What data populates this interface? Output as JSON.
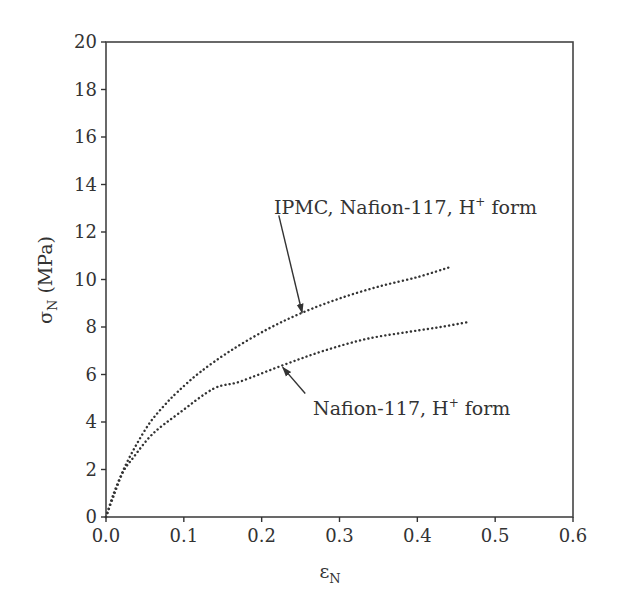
{
  "chart_data": {
    "type": "line",
    "title": "",
    "xlabel": "ε",
    "xlabel_sub": "N",
    "ylabel": "σ",
    "ylabel_sub": "N",
    "ylabel_unit": "(MPa)",
    "xlim": [
      0.0,
      0.6
    ],
    "ylim": [
      0,
      20
    ],
    "xticks": [
      "0.0",
      "0.1",
      "0.2",
      "0.3",
      "0.4",
      "0.5",
      "0.6"
    ],
    "yticks": [
      "0",
      "2",
      "4",
      "6",
      "8",
      "10",
      "12",
      "14",
      "16",
      "18",
      "20"
    ],
    "grid": false,
    "legend": "none (curves labeled with arrow annotations)",
    "series": [
      {
        "name": "IPMC, Nafion-117, H+ form",
        "style": "dotted",
        "x": [
          0.0,
          0.01,
          0.024,
          0.04,
          0.057,
          0.075,
          0.093,
          0.121,
          0.16,
          0.207,
          0.252,
          0.3,
          0.35,
          0.4,
          0.44
        ],
        "y": [
          0.0,
          1.0,
          2.1,
          3.1,
          4.0,
          4.7,
          5.3,
          6.1,
          7.0,
          7.9,
          8.6,
          9.2,
          9.7,
          10.1,
          10.5
        ]
      },
      {
        "name": "Nafion-117, H+ form",
        "style": "dotted",
        "x": [
          0.0,
          0.01,
          0.022,
          0.035,
          0.06,
          0.095,
          0.138,
          0.172,
          0.228,
          0.28,
          0.335,
          0.39,
          0.43,
          0.464
        ],
        "y": [
          0.0,
          0.9,
          1.9,
          2.5,
          3.5,
          4.4,
          5.4,
          5.7,
          6.4,
          7.0,
          7.5,
          7.8,
          8.0,
          8.2
        ]
      }
    ],
    "annotations": [
      {
        "text_main": "IPMC, Nafion-117, H",
        "text_sup": "+",
        "text_tail": " form",
        "points_to_series": 0,
        "arrow_from": [
          0.222,
          12.7
        ],
        "arrow_to": [
          0.252,
          8.6
        ]
      },
      {
        "text_main": "Nafion-117, H",
        "text_sup": "+",
        "text_tail": " form",
        "points_to_series": 1,
        "arrow_from": [
          0.256,
          5.2
        ],
        "arrow_to": [
          0.227,
          6.3
        ]
      }
    ],
    "colors": {
      "axis": "#333333",
      "curve": "#333333",
      "text": "#333333",
      "background": "#ffffff"
    }
  }
}
